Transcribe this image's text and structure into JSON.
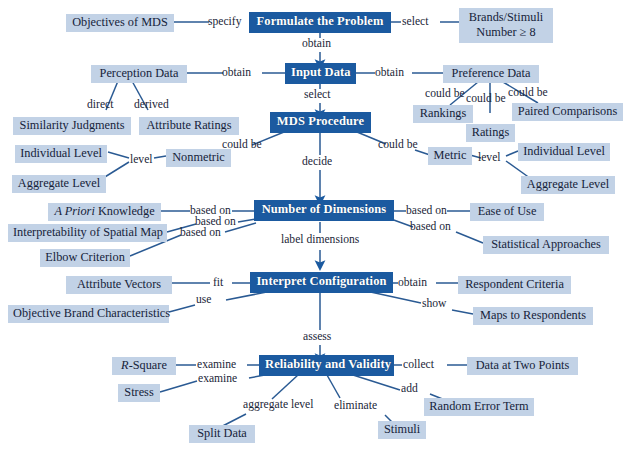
{
  "diagram": {
    "type": "concept-map",
    "colors": {
      "main_node_fill": "#1b5aa0",
      "main_node_text": "#ffffff",
      "leaf_node_fill": "#c2d2e6",
      "leaf_node_text": "#16233a",
      "edge_stroke": "#2a5a93",
      "arrow_fill": "#1b5aa0",
      "background": "#ffffff"
    },
    "main_nodes": [
      {
        "id": "formulate",
        "label": "Formulate the Problem"
      },
      {
        "id": "input_data",
        "label": "Input Data"
      },
      {
        "id": "mds_procedure",
        "label": "MDS Procedure"
      },
      {
        "id": "num_dimensions",
        "label": "Number of Dimensions"
      },
      {
        "id": "interpret_config",
        "label": "Interpret Configuration"
      },
      {
        "id": "reliability",
        "label": "Reliability and Validity"
      }
    ],
    "leaf_nodes": [
      {
        "id": "objectives",
        "label": "Objectives of MDS"
      },
      {
        "id": "brands_stimuli_l1",
        "label": "Brands/Stimuli"
      },
      {
        "id": "brands_stimuli_l2",
        "label": "Number ≥ 8"
      },
      {
        "id": "perception_data",
        "label": "Perception Data"
      },
      {
        "id": "preference_data",
        "label": "Preference Data"
      },
      {
        "id": "similarity_judgments",
        "label": "Similarity Judgments"
      },
      {
        "id": "attribute_ratings",
        "label": "Attribute Ratings"
      },
      {
        "id": "rankings",
        "label": "Rankings"
      },
      {
        "id": "ratings",
        "label": "Ratings"
      },
      {
        "id": "paired_comparisons",
        "label": "Paired Comparisons"
      },
      {
        "id": "nonmetric",
        "label": "Nonmetric"
      },
      {
        "id": "metric",
        "label": "Metric"
      },
      {
        "id": "individual_level_left",
        "label": "Individual Level"
      },
      {
        "id": "aggregate_level_left",
        "label": "Aggregate Level"
      },
      {
        "id": "individual_level_right",
        "label": "Individual Level"
      },
      {
        "id": "aggregate_level_right",
        "label": "Aggregate Level"
      },
      {
        "id": "a_priori",
        "label_italic": "A Priori",
        "label_rest": " Knowledge"
      },
      {
        "id": "interpretability",
        "label": "Interpretability of Spatial Map"
      },
      {
        "id": "elbow",
        "label": "Elbow Criterion"
      },
      {
        "id": "ease_of_use",
        "label": "Ease of Use"
      },
      {
        "id": "statistical_approaches",
        "label": "Statistical Approaches"
      },
      {
        "id": "attribute_vectors",
        "label": "Attribute Vectors"
      },
      {
        "id": "objective_brand",
        "label": "Objective Brand Characteristics"
      },
      {
        "id": "respondent_criteria",
        "label": "Respondent Criteria"
      },
      {
        "id": "maps_to_respondents",
        "label": "Maps to Respondents"
      },
      {
        "id": "r_square",
        "label_italic": "R",
        "label_rest": "-Square"
      },
      {
        "id": "stress",
        "label": "Stress"
      },
      {
        "id": "data_two_points",
        "label": "Data at Two Points"
      },
      {
        "id": "split_data",
        "label": "Split Data"
      },
      {
        "id": "stimuli",
        "label": "Stimuli"
      },
      {
        "id": "random_error",
        "label": "Random Error Term"
      }
    ],
    "edge_labels": [
      {
        "id": "e_specify",
        "text": "specify"
      },
      {
        "id": "e_select_brands",
        "text": "select"
      },
      {
        "id": "e_obtain_input",
        "text": "obtain"
      },
      {
        "id": "e_obtain_perception",
        "text": "obtain"
      },
      {
        "id": "e_obtain_preference",
        "text": "obtain"
      },
      {
        "id": "e_select_mds",
        "text": "select"
      },
      {
        "id": "e_direct",
        "text": "direct"
      },
      {
        "id": "e_derived",
        "text": "derived"
      },
      {
        "id": "e_couldbe_rankings",
        "text": "could be"
      },
      {
        "id": "e_couldbe_ratings",
        "text": "could be"
      },
      {
        "id": "e_couldbe_paired",
        "text": "could be"
      },
      {
        "id": "e_couldbe_nonmetric",
        "text": "could be"
      },
      {
        "id": "e_couldbe_metric",
        "text": "could be"
      },
      {
        "id": "e_level_left",
        "text": "level"
      },
      {
        "id": "e_level_right",
        "text": "level"
      },
      {
        "id": "e_decide",
        "text": "decide"
      },
      {
        "id": "e_basedon_apriori",
        "text": "based on"
      },
      {
        "id": "e_basedon_interp",
        "text": "based on"
      },
      {
        "id": "e_basedon_elbow",
        "text": "based on"
      },
      {
        "id": "e_basedon_ease",
        "text": "based on"
      },
      {
        "id": "e_basedon_stat",
        "text": "based on"
      },
      {
        "id": "e_label_dimensions",
        "text": "label dimensions"
      },
      {
        "id": "e_fit",
        "text": "fit"
      },
      {
        "id": "e_use",
        "text": "use"
      },
      {
        "id": "e_obtain_respondent",
        "text": "obtain"
      },
      {
        "id": "e_show",
        "text": "show"
      },
      {
        "id": "e_assess",
        "text": "assess"
      },
      {
        "id": "e_examine_rsquare",
        "text": "examine"
      },
      {
        "id": "e_examine_stress",
        "text": "examine"
      },
      {
        "id": "e_collect",
        "text": "collect"
      },
      {
        "id": "e_aggregate_level",
        "text": "aggregate level"
      },
      {
        "id": "e_eliminate",
        "text": "eliminate"
      },
      {
        "id": "e_add",
        "text": "add"
      }
    ]
  }
}
